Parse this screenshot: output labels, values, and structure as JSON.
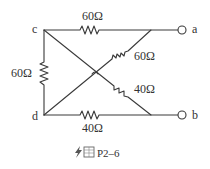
{
  "diagram": {
    "type": "circuit",
    "nodes": {
      "c": "c",
      "d": "d",
      "a": "a",
      "b": "b"
    },
    "resistors": {
      "top_c_a": "60Ω",
      "diag_center_a": "60Ω",
      "left_c_d": "60Ω",
      "diag_center_b": "40Ω",
      "bottom_d_b": "40Ω"
    },
    "caption": {
      "icon": "lightning-icon",
      "label": "P2–6",
      "prefix": "图"
    },
    "colors": {
      "line": "#3a3a3a",
      "text": "#333333",
      "background": "#ffffff"
    }
  }
}
